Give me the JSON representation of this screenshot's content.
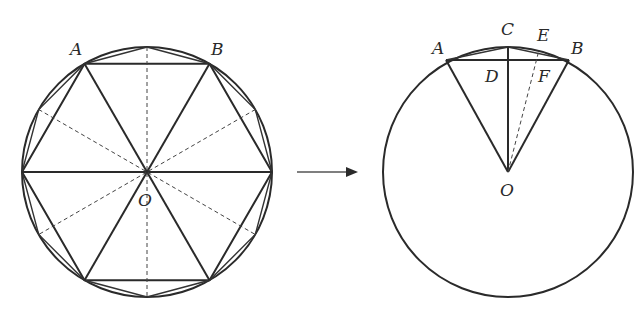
{
  "left_figure": {
    "description": "Circle with inscribed regular hexagon and dodecagon, center O",
    "labels": {
      "A": "A",
      "B": "B",
      "O": "O"
    }
  },
  "arrow": {
    "direction": "right"
  },
  "right_figure": {
    "description": "Circle with chord AB, midpoint arc point C, point E, D and F on AB, center O",
    "labels": {
      "A": "A",
      "B": "B",
      "C": "C",
      "D": "D",
      "E": "E",
      "F": "F",
      "O": "O"
    }
  }
}
